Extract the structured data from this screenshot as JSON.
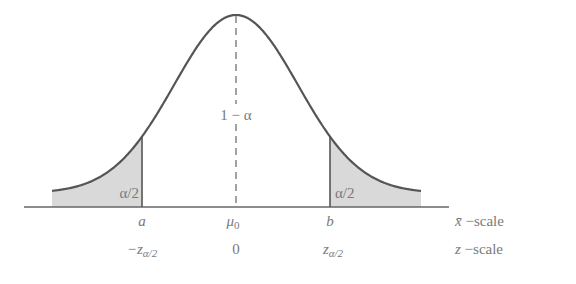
{
  "diagram": {
    "type": "normal-distribution-two-tailed",
    "curve_color": "#555555",
    "shade_color": "#d9d9d9",
    "text_color": "#7a7a7a",
    "center_region_label": "1 − α",
    "left_tail_label": "α/2",
    "right_tail_label": "α/2",
    "xbar_scale": {
      "ticks": [
        "a",
        "μ",
        "b"
      ],
      "center_subscript": "0",
      "axis_name": "x̄",
      "suffix": " −scale"
    },
    "z_scale": {
      "left_prefix": "−z",
      "left_subscript": "α/2",
      "center": "0",
      "right_prefix": "z",
      "right_subscript": "α/2",
      "axis_name": "z",
      "suffix": " −scale"
    }
  }
}
